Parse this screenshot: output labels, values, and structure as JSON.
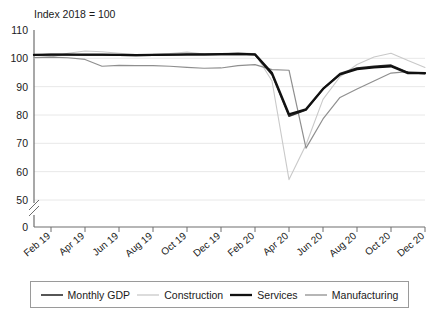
{
  "chart_data": {
    "type": "line",
    "title": "Index 2018 = 100",
    "xlabel": "",
    "ylabel": "",
    "ylim": [
      50,
      110
    ],
    "yticks": [
      50,
      60,
      70,
      80,
      90,
      100,
      110
    ],
    "axis_break": {
      "present": true,
      "between": [
        0,
        50
      ],
      "zero_label": "0"
    },
    "grid": "horizontal",
    "legend_position": "bottom",
    "x": [
      "Jan 19",
      "Feb 19",
      "Mar 19",
      "Apr 19",
      "May 19",
      "Jun 19",
      "Jul 19",
      "Aug 19",
      "Sep 19",
      "Oct 19",
      "Nov 19",
      "Dec 19",
      "Jan 20",
      "Feb 20",
      "Mar 20",
      "Apr 20",
      "May 20",
      "Jun 20",
      "Jul 20",
      "Aug 20",
      "Sep 20",
      "Oct 20",
      "Nov 20",
      "Dec 20"
    ],
    "xtick_labels": [
      "Feb 19",
      "Apr 19",
      "Jun 19",
      "Aug 19",
      "Oct 19",
      "Dec 19",
      "Feb 20",
      "Apr 20",
      "Jun 20",
      "Aug 20",
      "Oct 20",
      "Dec 20"
    ],
    "xtick_indices": [
      1,
      3,
      5,
      7,
      9,
      11,
      13,
      15,
      17,
      19,
      21,
      23
    ],
    "series": [
      {
        "name": "Monthly GDP",
        "color": "#2b2b2b",
        "width": 1.6,
        "values": [
          101.2,
          101.3,
          101.3,
          101.2,
          101.2,
          101.1,
          101.0,
          101.1,
          101.2,
          101.3,
          101.3,
          101.4,
          101.5,
          101.3,
          94.2,
          79.6,
          81.8,
          89.2,
          94.6,
          96.6,
          97.2,
          97.6,
          95.0,
          94.6
        ]
      },
      {
        "name": "Construction",
        "color": "#c9c9c9",
        "width": 1.1,
        "values": [
          100.1,
          100.5,
          101.8,
          102.6,
          102.3,
          101.8,
          101.3,
          101.4,
          101.7,
          102.2,
          101.5,
          101.4,
          102.0,
          101.6,
          92.0,
          57.2,
          69.5,
          85.5,
          93.5,
          97.8,
          100.5,
          101.8,
          99.2,
          96.8
        ]
      },
      {
        "name": "Services",
        "color": "#111111",
        "width": 2.3,
        "values": [
          101.2,
          101.3,
          101.3,
          101.3,
          101.3,
          101.2,
          101.1,
          101.2,
          101.3,
          101.4,
          101.4,
          101.5,
          101.6,
          101.4,
          94.8,
          80.2,
          82.0,
          89.2,
          94.3,
          96.2,
          96.8,
          97.2,
          94.8,
          94.8
        ]
      },
      {
        "name": "Manufacturing",
        "color": "#8f8f8f",
        "width": 1.2,
        "values": [
          100.3,
          100.4,
          100.2,
          99.6,
          97.2,
          97.5,
          97.4,
          97.4,
          97.2,
          96.8,
          96.5,
          96.6,
          97.4,
          97.8,
          96.0,
          95.8,
          68.3,
          78.6,
          86.2,
          89.2,
          92.0,
          94.8,
          95.3,
          95.0
        ]
      }
    ]
  },
  "legend": {
    "items": [
      {
        "label": "Monthly GDP"
      },
      {
        "label": "Construction"
      },
      {
        "label": "Services"
      },
      {
        "label": "Manufacturing"
      }
    ]
  }
}
